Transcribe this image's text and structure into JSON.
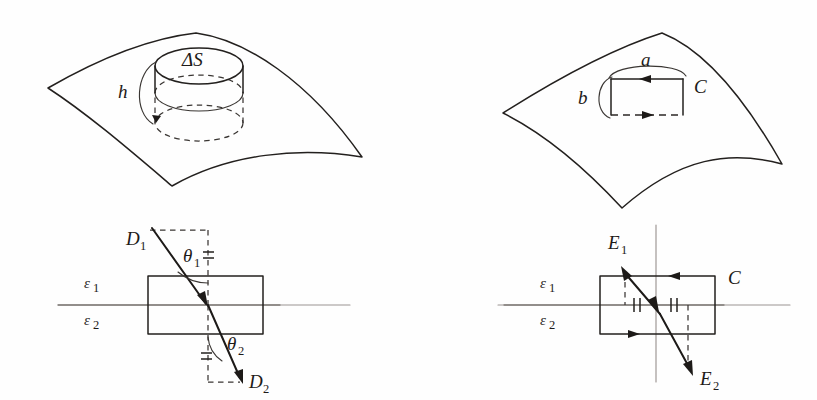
{
  "figure": {
    "background_color": "#fefefe",
    "ink_color": "#23201e",
    "panels": [
      {
        "id": "top-left",
        "name": "gaussian-pillbox-on-surface",
        "description": "Curved surface element with a short cylindrical pillbox straddling it",
        "labels": [
          {
            "key": "delta_s",
            "text": "ΔS",
            "role": "pillbox-top-face-area"
          },
          {
            "key": "height",
            "text": "h",
            "role": "pillbox-height"
          }
        ]
      },
      {
        "id": "top-right",
        "name": "amperian-loop-on-surface",
        "description": "Curved surface element with a rectangular circulation loop C straddling it",
        "labels": [
          {
            "key": "side_a",
            "text": "a",
            "role": "loop-long-side"
          },
          {
            "key": "side_b",
            "text": "b",
            "role": "loop-short-side"
          },
          {
            "key": "contour",
            "text": "C",
            "role": "contour-name"
          }
        ]
      },
      {
        "id": "bottom-left",
        "name": "normal-displacement-continuity",
        "description": "D field refracting across the interface between dielectrics with pillbox",
        "labels": [
          {
            "key": "d1",
            "text": "D",
            "sub": "1",
            "role": "incident-displacement-vector"
          },
          {
            "key": "d2",
            "text": "D",
            "sub": "2",
            "role": "transmitted-displacement-vector"
          },
          {
            "key": "theta1",
            "text": "θ",
            "sub": "1",
            "role": "incidence-angle"
          },
          {
            "key": "theta2",
            "text": "θ",
            "sub": "2",
            "role": "refraction-angle"
          },
          {
            "key": "eps1",
            "text": "ε",
            "sub": "1",
            "role": "permittivity-upper-medium"
          },
          {
            "key": "eps2",
            "text": "ε",
            "sub": "2",
            "role": "permittivity-lower-medium"
          }
        ]
      },
      {
        "id": "bottom-right",
        "name": "tangential-field-continuity",
        "description": "E field across interface with circulation loop C and equal tangential tick marks",
        "labels": [
          {
            "key": "e1",
            "text": "E",
            "sub": "1",
            "role": "incident-electric-field-vector"
          },
          {
            "key": "e2",
            "text": "E",
            "sub": "2",
            "role": "transmitted-electric-field-vector"
          },
          {
            "key": "contour",
            "text": "C",
            "role": "contour-name"
          },
          {
            "key": "eps1",
            "text": "ε",
            "sub": "1",
            "role": "permittivity-upper-medium"
          },
          {
            "key": "eps2",
            "text": "ε",
            "sub": "2",
            "role": "permittivity-lower-medium"
          }
        ]
      }
    ]
  },
  "text": {
    "delta_s": "ΔS",
    "h": "h",
    "a": "a",
    "b": "b",
    "C_top": "C",
    "C_bottom": "C",
    "D": "D",
    "E": "E",
    "theta": "θ",
    "epsilon": "ε",
    "one": "1",
    "two": "2"
  }
}
